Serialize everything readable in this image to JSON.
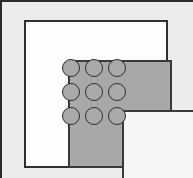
{
  "figure": {
    "title": "Nested square frames with 3x3 dot grid",
    "type": "nested-frames-diagram",
    "canvas": {
      "width": 193,
      "height": 178,
      "background": "#ffffff",
      "cropped_edges": "bottom, right"
    }
  },
  "layers": [
    {
      "name": "outer-mat",
      "label": "Outer mat",
      "fill": "#ececeb",
      "stroke": "#2b2b2b",
      "stroke_width": 2
    },
    {
      "name": "white-frame",
      "label": "White frame",
      "fill": "#fdfdfd",
      "stroke": "#2f2f2f",
      "stroke_width": 2
    },
    {
      "name": "gray-band",
      "label": "Gray band",
      "fill": "#a8a8a8",
      "stroke": "#3a3a3a",
      "stroke_width": 2
    },
    {
      "name": "inner-panel",
      "label": "Inner panel",
      "fill": "#f6f6f4",
      "stroke": "#3a3a3a",
      "stroke_width": 2
    }
  ],
  "dot_grid": {
    "rows": 3,
    "columns": 3,
    "count": 9,
    "shape": "circle",
    "fill": "#a9a9a9",
    "stroke": "#2e2e2e",
    "diameter": 18,
    "cells": [
      {
        "id": "dot-r1-c1",
        "row": 1,
        "col": 1
      },
      {
        "id": "dot-r1-c2",
        "row": 1,
        "col": 2
      },
      {
        "id": "dot-r1-c3",
        "row": 1,
        "col": 3
      },
      {
        "id": "dot-r2-c1",
        "row": 2,
        "col": 1
      },
      {
        "id": "dot-r2-c2",
        "row": 2,
        "col": 2
      },
      {
        "id": "dot-r2-c3",
        "row": 2,
        "col": 3
      },
      {
        "id": "dot-r3-c1",
        "row": 3,
        "col": 1
      },
      {
        "id": "dot-r3-c2",
        "row": 3,
        "col": 2
      },
      {
        "id": "dot-r3-c3",
        "row": 3,
        "col": 3
      }
    ]
  }
}
